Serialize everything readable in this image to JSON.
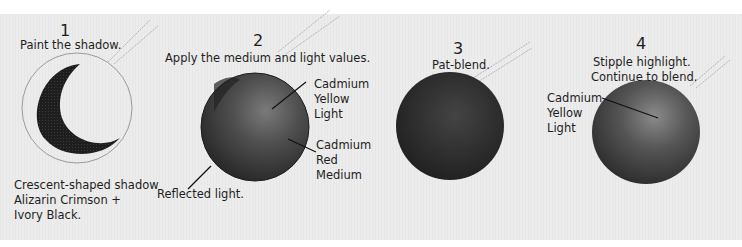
{
  "steps": [
    {
      "number": "1",
      "caption": "Paint the shadow.",
      "notes": [
        "Crescent-shaped shadow",
        "Alizarin Crimson +",
        "Ivory Black."
      ]
    },
    {
      "number": "2",
      "caption": "Apply the medium and light values.",
      "labels": {
        "highlight": [
          "Cadmium",
          "Yellow",
          "Light"
        ],
        "midtone": [
          "Cadmium",
          "Red",
          "Medium"
        ],
        "reflected": "Reflected light."
      }
    },
    {
      "number": "3",
      "caption": "Pat-blend."
    },
    {
      "number": "4",
      "caption_lines": [
        "Stipple highlight.",
        "Continue to blend."
      ],
      "labels": {
        "highlight": [
          "Cadmium",
          "Yellow",
          "Light"
        ]
      }
    }
  ],
  "colors": {
    "panel": "#ebebeb",
    "sphere_dark": "#2a2a2a",
    "sphere_mid": "#555555",
    "text": "#1e1e1e"
  }
}
